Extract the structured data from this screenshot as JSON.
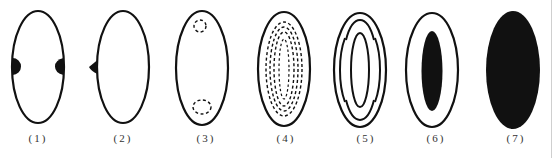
{
  "figure": {
    "panels": [
      {
        "id": "1",
        "label": "(1)",
        "description": "outline ellipse with two dark half-disc bumps on left and right sides"
      },
      {
        "id": "2",
        "label": "(2)",
        "description": "outline ellipse with small dark triangular bump on left side"
      },
      {
        "id": "3",
        "label": "(3)",
        "description": "outline ellipse with dashed small rings near top and bottom"
      },
      {
        "id": "4",
        "label": "(4)",
        "description": "outline ellipse containing multiple concentric dashed ellipses"
      },
      {
        "id": "5",
        "label": "(5)",
        "description": "outline ellipse with two inner arc pairs and an inner closed ellipse"
      },
      {
        "id": "6",
        "label": "(6)",
        "description": "outline ellipse with filled dark inner ellipse"
      },
      {
        "id": "7",
        "label": "(7)",
        "description": "fully filled dark ellipse"
      }
    ],
    "colors": {
      "stroke": "#111111",
      "fill": "#111111",
      "background": "#ffffff",
      "label": "#333333"
    }
  }
}
